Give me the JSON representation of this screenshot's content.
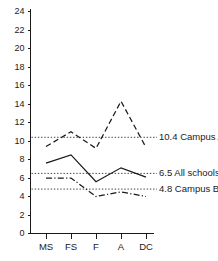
{
  "chart_data": {
    "type": "line",
    "title": "",
    "xlabel": "",
    "ylabel": "",
    "categories": [
      "MS",
      "FS",
      "F",
      "A",
      "DC"
    ],
    "ylim": [
      0,
      24
    ],
    "xlim": [
      0,
      4
    ],
    "grid": false,
    "legend_position": "right-inline-annotations",
    "yticks": [
      0,
      2,
      4,
      6,
      8,
      10,
      12,
      14,
      16,
      18,
      20,
      22,
      24
    ],
    "series": [
      {
        "name": "Campus A",
        "style": "dashed",
        "values": [
          9.4,
          11.0,
          9.2,
          14.3,
          9.3
        ]
      },
      {
        "name": "All schools",
        "style": "solid",
        "values": [
          7.6,
          8.5,
          5.6,
          7.1,
          6.1
        ]
      },
      {
        "name": "Campus B",
        "style": "dashdot",
        "values": [
          6.0,
          6.0,
          4.0,
          4.5,
          4.0
        ]
      }
    ],
    "reference_lines": [
      {
        "value": 10.4,
        "label_value": "10.4",
        "label_name": "Campus A",
        "style": "dotted"
      },
      {
        "value": 6.5,
        "label_value": "6.5",
        "label_name": "All schools",
        "style": "dotted"
      },
      {
        "value": 4.8,
        "label_value": "4.8",
        "label_name": "Campus B",
        "style": "dotted"
      }
    ],
    "annotations": [
      {
        "text": "10.4  Campus A",
        "value": 10.4
      },
      {
        "text": "6.5  All schools",
        "value": 6.5
      },
      {
        "text": "4.8  Campus B",
        "value": 4.8
      }
    ],
    "ytick_labels": [
      "0",
      "2",
      "4",
      "6",
      "8",
      "10",
      "12",
      "14",
      "16",
      "18",
      "20",
      "22",
      "24"
    ],
    "xtick_labels": [
      "MS",
      "FS",
      "F",
      "A",
      "DC"
    ],
    "colors": {
      "axis": "#1a1a1a",
      "series": "#1a1a1a",
      "reference": "#2b2b2b",
      "background": "#ffffff"
    }
  }
}
